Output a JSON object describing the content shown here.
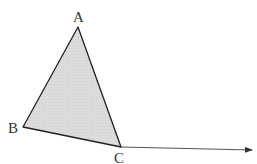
{
  "diagram": {
    "type": "geometry",
    "shape": "triangle",
    "fill_color": "#d9d9d9",
    "stroke_color": "#222222",
    "ray_color": "#555555",
    "vertices": [
      {
        "name": "A",
        "label": "A",
        "x": 78,
        "y": 27
      },
      {
        "name": "B",
        "label": "B",
        "x": 23,
        "y": 127
      },
      {
        "name": "C",
        "label": "C",
        "x": 121,
        "y": 147
      }
    ],
    "ray": {
      "from": "C",
      "to_x": 254,
      "to_y": 150
    }
  }
}
